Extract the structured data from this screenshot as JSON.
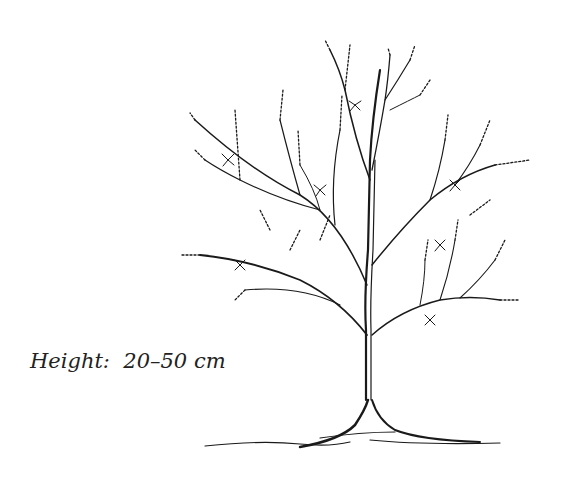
{
  "illustration": {
    "subject": "shrub line drawing",
    "caption": "Height:  20–50 cm",
    "ink_color": "#1a1a1a",
    "background_color": "#ffffff"
  }
}
